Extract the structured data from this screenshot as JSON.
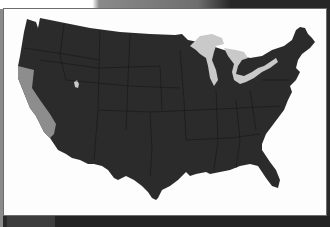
{
  "map": {
    "title": "United States map",
    "highlighted_regions": [
      "California",
      "Nevada (western portion)"
    ],
    "colors": {
      "land": "#2b2b2b",
      "state_borders": "#1a1a1a",
      "highlight": "#8d8d8d",
      "lakes": "#c9c9c9",
      "background": "#fdfdfd",
      "frame": "#232323"
    }
  }
}
